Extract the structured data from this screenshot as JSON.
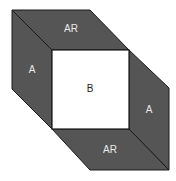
{
  "diagram": {
    "regions": [
      {
        "id": "top",
        "label": "AR",
        "color": "#555555"
      },
      {
        "id": "left",
        "label": "A",
        "color": "#555555"
      },
      {
        "id": "center",
        "label": "B",
        "color": "#ffffff"
      },
      {
        "id": "right",
        "label": "A",
        "color": "#555555"
      },
      {
        "id": "bottom",
        "label": "AR",
        "color": "#555555"
      }
    ]
  }
}
